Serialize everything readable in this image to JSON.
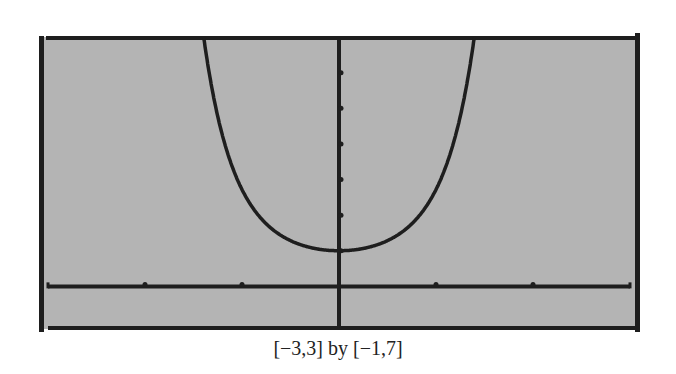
{
  "figure": {
    "caption": "[−3,3] by [−1,7]",
    "colors": {
      "background": "#b4b4b4",
      "ink": "#1e1e1e",
      "page": "#ffffff"
    }
  },
  "chart_data": {
    "type": "line",
    "title": "",
    "xlabel": "",
    "ylabel": "",
    "caption": "[−3,3] by [−1,7]",
    "xlim": [
      -3,
      3
    ],
    "ylim": [
      -1,
      7
    ],
    "x_ticks": [
      -2,
      -1,
      1,
      2
    ],
    "y_ticks": [
      1,
      2,
      3,
      4,
      5,
      6
    ],
    "tick_labels_shown": false,
    "grid": false,
    "legend": null,
    "series": [
      {
        "name": "y = e^(x^2)",
        "x": [
          -1.4,
          -1.3,
          -1.24,
          -1.15,
          -1.01,
          -0.9,
          -0.75,
          -0.6,
          -0.39,
          -0.2,
          0.0,
          0.2,
          0.39,
          0.6,
          0.75,
          0.9,
          1.01,
          1.15,
          1.24,
          1.3,
          1.4
        ],
        "values": [
          7.0,
          5.4,
          4.7,
          3.8,
          2.8,
          2.25,
          1.75,
          1.43,
          1.16,
          1.04,
          1.0,
          1.04,
          1.16,
          1.43,
          1.75,
          2.25,
          2.8,
          3.8,
          4.7,
          5.4,
          7.0
        ]
      }
    ]
  }
}
